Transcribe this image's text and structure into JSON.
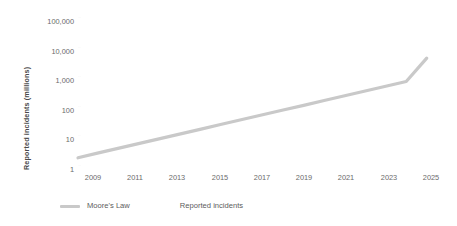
{
  "chart_data": {
    "type": "line",
    "title": "",
    "xlabel": "",
    "ylabel": "Reported incidents (millions)",
    "yscale": "log",
    "ylim": [
      1,
      100000
    ],
    "xlim": [
      2008,
      2025.5
    ],
    "grid": true,
    "legend_position": "bottom-left",
    "y_ticks": [
      "1",
      "10",
      "100",
      "1,000",
      "10,000",
      "100,000"
    ],
    "y_tick_values": [
      1,
      10,
      100,
      1000,
      10000,
      100000
    ],
    "x_ticks": [
      "2009",
      "2011",
      "2013",
      "2015",
      "2017",
      "2019",
      "2021",
      "2023",
      "2025"
    ],
    "x_tick_values": [
      2009,
      2011,
      2013,
      2015,
      2017,
      2019,
      2021,
      2023,
      2025
    ],
    "series": [
      {
        "name": "Moore's Law",
        "color": "#c9c9c9",
        "x": [
          2008,
          2009,
          2010,
          2011,
          2012,
          2013,
          2014,
          2015,
          2016,
          2017,
          2018,
          2019,
          2020,
          2021,
          2022,
          2023,
          2024,
          2025
        ],
        "values": [
          3.5,
          5,
          7.1,
          10,
          14.2,
          20,
          28.4,
          40.2,
          56.8,
          80.3,
          113.5,
          160.4,
          226.8,
          320.6,
          453.2,
          640.7,
          905.8,
          5000
        ]
      },
      {
        "name": "Reported incidents",
        "color": "#c9c9c9",
        "x": [],
        "values": []
      }
    ],
    "legend": [
      {
        "label": "Moore's Law",
        "swatch": "line",
        "color": "#c9c9c9"
      },
      {
        "label": "Reported incidents",
        "swatch": "none",
        "color": "#c9c9c9"
      }
    ],
    "colors": {
      "line": "#c9c9c9",
      "text": "#6b6b6b",
      "axis_title": "#4a4a4a",
      "gridline": "#fbfbfb",
      "background": "#ffffff"
    }
  }
}
